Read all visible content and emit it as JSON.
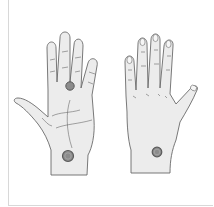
{
  "figure": {
    "colors": {
      "skin": "#ececec",
      "outline": "#6a6a6a",
      "marker": "#8c8c8c",
      "marker_ring": "#5a5a5a",
      "background": "#ffffff"
    },
    "left_hand": {
      "view": "palm",
      "markers": [
        "finger-base",
        "wrist"
      ]
    },
    "right_hand": {
      "view": "back",
      "markers": [
        "wrist"
      ]
    }
  }
}
